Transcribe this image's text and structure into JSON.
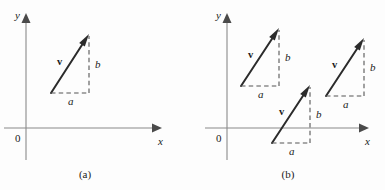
{
  "figure": {
    "background_color": "#fdfdfd",
    "ink_color": "#1a1a1a",
    "axis_color": "#8a8a8a",
    "vector_color": "#2b2b2b",
    "dash_color": "#555555",
    "panels": [
      {
        "caption": "(a)",
        "caption_x": 85,
        "caption_y": 178,
        "axes": {
          "origin_label": "0",
          "origin_label_x": 15,
          "origin_label_y": 142,
          "x_label": "x",
          "x_label_x": 158,
          "x_label_y": 145,
          "y_label": "y",
          "y_label_x": 15,
          "y_label_y": 19,
          "x_axis_y": 128,
          "x_axis_from": 4,
          "x_axis_to": 162,
          "y_axis_x": 26,
          "y_axis_from": 160,
          "y_axis_to": 13
        },
        "vectors": [
          {
            "label": "v",
            "label_x": 57,
            "label_y": 65,
            "tail_x": 51,
            "tail_y": 93,
            "tip_x": 89,
            "tip_y": 34,
            "component_a_label": "a",
            "component_a_x": 68,
            "component_a_y": 105,
            "component_b_label": "b",
            "component_b_x": 95,
            "component_b_y": 68
          }
        ]
      },
      {
        "caption": "(b)",
        "caption_x": 288,
        "caption_y": 178,
        "axes": {
          "origin_label": "0",
          "origin_label_x": 216,
          "origin_label_y": 142,
          "x_label": "x",
          "x_label_x": 365,
          "x_label_y": 145,
          "y_label": "y",
          "y_label_x": 216,
          "y_label_y": 19,
          "x_axis_y": 128,
          "x_axis_from": 205,
          "x_axis_to": 369,
          "y_axis_x": 227,
          "y_axis_from": 160,
          "y_axis_to": 13
        },
        "vectors": [
          {
            "label": "v",
            "label_x": 248,
            "label_y": 58,
            "tail_x": 241,
            "tail_y": 86,
            "tip_x": 279,
            "tip_y": 28,
            "component_a_label": "a",
            "component_a_x": 258,
            "component_a_y": 98,
            "component_b_label": "b",
            "component_b_x": 285,
            "component_b_y": 61
          },
          {
            "label": "v",
            "label_x": 279,
            "label_y": 115,
            "tail_x": 272,
            "tail_y": 143,
            "tip_x": 310,
            "tip_y": 85,
            "component_a_label": "a",
            "component_a_x": 289,
            "component_a_y": 155,
            "component_b_label": "b",
            "component_b_x": 316,
            "component_b_y": 118
          },
          {
            "label": "v",
            "label_x": 332,
            "label_y": 68,
            "tail_x": 326,
            "tail_y": 96,
            "tip_x": 364,
            "tip_y": 38,
            "component_a_label": "a",
            "component_a_x": 343,
            "component_a_y": 108,
            "component_b_label": "b",
            "component_b_x": 370,
            "component_b_y": 71
          }
        ]
      }
    ]
  }
}
